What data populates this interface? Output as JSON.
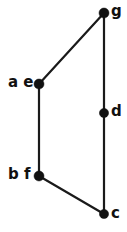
{
  "diagram": {
    "type": "lattice-hasse-diagram",
    "title": "",
    "background_color": "#ffffff",
    "ink_color": "#111111",
    "canvas": {
      "width": 127,
      "height": 232
    },
    "vertices": [
      {
        "id": "g",
        "label": "g",
        "x": 104,
        "y": 13,
        "radius": 5.0,
        "label_x": 111,
        "label_y": 4,
        "label_side": "right"
      },
      {
        "id": "ae",
        "label": "a e",
        "x": 39,
        "y": 84,
        "radius": 5.0,
        "label_x": 8,
        "label_y": 75,
        "label_side": "left"
      },
      {
        "id": "d",
        "label": "d",
        "x": 104,
        "y": 113,
        "radius": 4.6,
        "label_x": 111,
        "label_y": 104,
        "label_side": "right"
      },
      {
        "id": "bf",
        "label": "b f",
        "x": 39,
        "y": 176,
        "radius": 5.0,
        "label_x": 8,
        "label_y": 167,
        "label_side": "left"
      },
      {
        "id": "c",
        "label": "c",
        "x": 104,
        "y": 214,
        "radius": 4.6,
        "label_x": 111,
        "label_y": 206,
        "label_side": "right"
      }
    ],
    "edges": [
      {
        "id": "edge-ae-g",
        "from": "ae",
        "to": "g",
        "x1": 39,
        "y1": 84,
        "x2": 104,
        "y2": 13
      },
      {
        "id": "edge-ae-bf",
        "from": "ae",
        "to": "bf",
        "x1": 39,
        "y1": 84,
        "x2": 39,
        "y2": 176
      },
      {
        "id": "edge-g-d",
        "from": "g",
        "to": "d",
        "x1": 104,
        "y1": 13,
        "x2": 104,
        "y2": 113
      },
      {
        "id": "edge-d-c",
        "from": "d",
        "to": "c",
        "x1": 104,
        "y1": 113,
        "x2": 104,
        "y2": 214
      },
      {
        "id": "edge-bf-c",
        "from": "bf",
        "to": "c",
        "x1": 39,
        "y1": 176,
        "x2": 104,
        "y2": 214
      }
    ]
  }
}
